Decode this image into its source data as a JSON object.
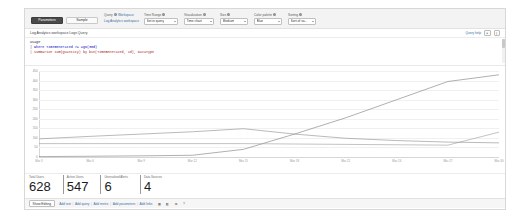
{
  "toolbar": {
    "tabs": [
      {
        "label": "Parameters",
        "selected": true
      },
      {
        "label": "Sample",
        "selected": false
      }
    ],
    "query_group_label": "Query",
    "query_source_label": "Workspace",
    "query_value": "Log Analytics workspace",
    "fields": [
      {
        "name": "time-range",
        "label": "Time Range",
        "value": "Set in query"
      },
      {
        "name": "visualization",
        "label": "Visualization",
        "value": "Time chart"
      },
      {
        "name": "size",
        "label": "Size",
        "value": "Medium"
      },
      {
        "name": "color-palette",
        "label": "Color palette",
        "value": "Blue"
      },
      {
        "name": "sorting",
        "label": "Sorting",
        "value": "Sort of va..."
      }
    ]
  },
  "query_panel": {
    "title": "Log Analytics workspace Logs Query",
    "help_label": "Query help",
    "icons": [
      "expand-icon",
      "more-icon"
    ],
    "code_lines": [
      "Usage",
      "| where TimeGenerated >= ago(30d)",
      "| summarize sum(Quantity) by bin(TimeGenerated, 1d), DataType"
    ]
  },
  "chart_data": {
    "type": "line",
    "title": "",
    "xlabel": "",
    "ylabel": "",
    "ylim": [
      0,
      450
    ],
    "grid": true,
    "legend": "none",
    "yticks": [
      0,
      50,
      100,
      150,
      200,
      250,
      300,
      350,
      400,
      450
    ],
    "x": [
      "Mar 3",
      "Mar 6",
      "Mar 9",
      "Mar 12",
      "Mar 15",
      "Mar 18",
      "Mar 21",
      "Mar 24",
      "Mar 27",
      "Mar 30"
    ],
    "xticks": [
      "Mar 3",
      "Mar 6",
      "Mar 9",
      "Mar 12",
      "Mar 15",
      "Mar 18",
      "Mar 21",
      "Mar 24",
      "Mar 27",
      "Mar 30"
    ],
    "series": [
      {
        "name": "AzureDiagnostics",
        "color": "#7a7a7a",
        "values": [
          2,
          4,
          6,
          9,
          40,
          120,
          205,
          300,
          395,
          430
        ]
      },
      {
        "name": "Perf",
        "color": "#8c8c8c",
        "values": [
          95,
          108,
          120,
          132,
          148,
          120,
          98,
          86,
          78,
          74
        ]
      },
      {
        "name": "Heartbeat",
        "color": "#9a9a9a",
        "values": [
          70,
          70,
          70,
          70,
          70,
          68,
          66,
          64,
          62,
          130
        ]
      }
    ]
  },
  "kpis": [
    {
      "label": "Total Users",
      "value": "628"
    },
    {
      "label": "Active Users",
      "value": "547"
    },
    {
      "label": "Unresolved Alerts",
      "value": "6"
    },
    {
      "label": "Data Sources",
      "value": "4"
    }
  ],
  "footer": {
    "edit_button": "Show Editing",
    "links": [
      "Add text",
      "Add query",
      "Add metric",
      "Add parameters",
      "Add links"
    ],
    "icons": [
      "grid-icon",
      "group-icon",
      "clone-icon",
      "help-icon"
    ]
  }
}
